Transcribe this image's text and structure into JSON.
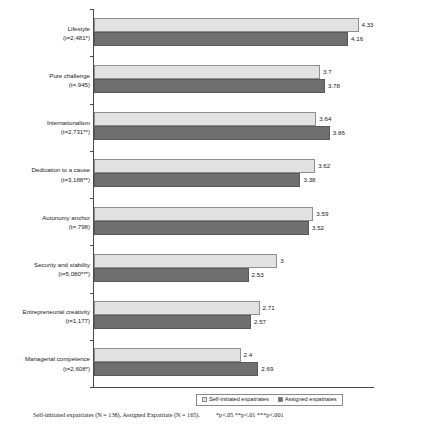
{
  "chart_data": {
    "type": "bar",
    "orientation": "horizontal",
    "title": "",
    "xlabel": "",
    "ylabel": "",
    "xlim": [
      0,
      4.6
    ],
    "grid": false,
    "legend_position": "bottom-center",
    "categories": [
      "Lifestyle",
      "Pure challenge",
      "Internationalism",
      "Dedication to a cause",
      "Autonomy anchor",
      "Security and stability",
      "Entrepreneurial creativity",
      "Managerial competence"
    ],
    "category_stats": [
      "(t=2,481*)",
      "(t=.945)",
      "(t=2,731**)",
      "(t=3,188**)",
      "(t=.798)",
      "(t=5,080***)",
      "(t=1,177)",
      "(t=2,608*)"
    ],
    "series": [
      {
        "name": "Self-initiated expatriates",
        "color": "#e2e2e2",
        "values": [
          4.33,
          3.7,
          3.64,
          3.62,
          3.59,
          3,
          2.71,
          2.4
        ],
        "labels": [
          "4.33",
          "3.7",
          "3.64",
          "3.62",
          "3.59",
          "3",
          "2.71",
          "2.4"
        ]
      },
      {
        "name": "Assigned expatriates",
        "color": "#6f6f6f",
        "values": [
          4.16,
          3.78,
          3.86,
          3.38,
          3.52,
          2.53,
          2.57,
          2.69
        ],
        "labels": [
          "4.16",
          "3.78",
          "3.86",
          "3.38",
          "3.52",
          "2.53",
          "2.57",
          "2.69"
        ]
      }
    ]
  },
  "legend": {
    "items": [
      {
        "label": "Self-initiated expatriates"
      },
      {
        "label": "Assigned expatriates"
      }
    ]
  },
  "footnote": {
    "sample": "Self-initiated expatriates (N = 138), Assigned Expatriate (N = 165).",
    "significance": "*p<.05 **p<.01 ***p<.001"
  },
  "colors": {
    "self_initiated": "#e2e2e2",
    "assigned": "#6f6f6f",
    "axis": "#4a4a4a",
    "background": "#ffffff"
  }
}
